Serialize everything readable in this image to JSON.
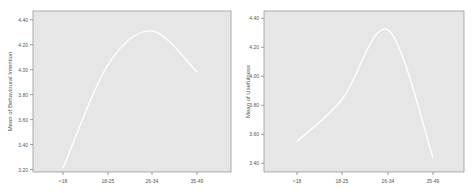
{
  "chart_data": [
    {
      "type": "line",
      "title": "",
      "xlabel": "",
      "ylabel": "Mean of Behavioural Intention",
      "categories": [
        "<18",
        "18-25",
        "26-34",
        "35-49"
      ],
      "values": [
        3.21,
        4.04,
        4.31,
        3.98
      ],
      "yticks": [
        "4.40",
        "4.20",
        "4.00",
        "3.80",
        "3.60",
        "3.40",
        "3.20"
      ],
      "ylim": [
        3.18,
        4.47
      ],
      "grid": false,
      "smooth": true,
      "colors": {
        "plot_bg": "#e6e6e6",
        "line": "#ffffff",
        "axis": "#888888"
      }
    },
    {
      "type": "line",
      "title": "",
      "xlabel": "",
      "ylabel": "Mean of Usefulness",
      "categories": [
        "<18",
        "18-25",
        "26-34",
        "35-49"
      ],
      "values": [
        3.55,
        3.84,
        4.32,
        3.44
      ],
      "yticks": [
        "4.40",
        "4.20",
        "4.00",
        "3.80",
        "3.60",
        "3.40"
      ],
      "ylim": [
        3.34,
        4.45
      ],
      "grid": false,
      "smooth": true,
      "colors": {
        "plot_bg": "#e6e6e6",
        "line": "#ffffff",
        "axis": "#888888"
      }
    }
  ]
}
